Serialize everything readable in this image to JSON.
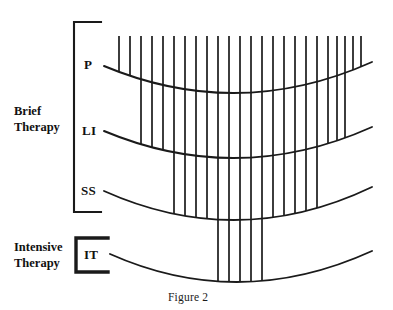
{
  "figure": {
    "caption": "Figure 2",
    "background_color": "#ffffff",
    "ink_color": "#1a1a1a"
  },
  "groups": [
    {
      "id": "brief",
      "label_lines": [
        "Brief",
        "Therapy"
      ],
      "label_text": "Brief Therapy",
      "bracket": {
        "x": 74,
        "top": 22,
        "bottom": 212,
        "arm": 27,
        "weight": "thin"
      },
      "rows": [
        "P",
        "LI",
        "SS"
      ]
    },
    {
      "id": "intensive",
      "label_lines": [
        "Intensive",
        "Therapy"
      ],
      "label_text": "Intensive Therapy",
      "bracket": {
        "x": 76,
        "top": 238,
        "bottom": 272,
        "arm": 32,
        "weight": "thick"
      },
      "rows": [
        "IT"
      ]
    }
  ],
  "rows": [
    {
      "id": "P",
      "label": "P",
      "full_name": "P",
      "curve": {
        "x_start": 104,
        "y_start": 66,
        "x_mid": 238,
        "y_mid": 93,
        "x_end": 372,
        "y_end": 62
      },
      "ribs_reaching": 24
    },
    {
      "id": "LI",
      "label": "LI",
      "full_name": "LI",
      "curve": {
        "x_start": 104,
        "y_start": 131,
        "x_mid": 238,
        "y_mid": 158,
        "x_end": 372,
        "y_end": 127
      },
      "ribs_reaching": 19
    },
    {
      "id": "SS",
      "label": "SS",
      "full_name": "SS",
      "curve": {
        "x_start": 104,
        "y_start": 191,
        "x_mid": 238,
        "y_mid": 220,
        "x_end": 372,
        "y_end": 187
      },
      "ribs_reaching": 14
    },
    {
      "id": "IT",
      "label": "IT",
      "full_name": "IT",
      "curve": {
        "x_start": 110,
        "y_start": 254,
        "x_mid": 240,
        "y_mid": 282,
        "x_end": 372,
        "y_end": 251
      },
      "ribs_reaching": 4
    }
  ],
  "ribs": {
    "count_total": 24,
    "top_y": 36,
    "x_positions": [
      119,
      130,
      141,
      152,
      163,
      174,
      185,
      196,
      207,
      218,
      229,
      240,
      251,
      262,
      273,
      284,
      295,
      306,
      317,
      328,
      337,
      345,
      353,
      361
    ],
    "depth_index": [
      0,
      0,
      1,
      1,
      1,
      2,
      2,
      2,
      2,
      3,
      3,
      3,
      3,
      3,
      2,
      2,
      2,
      2,
      2,
      1,
      1,
      1,
      0,
      0
    ],
    "depth_legend": {
      "0": "ends at P curve",
      "1": "ends at LI curve",
      "2": "ends at SS curve",
      "3": "ends at IT curve"
    }
  }
}
